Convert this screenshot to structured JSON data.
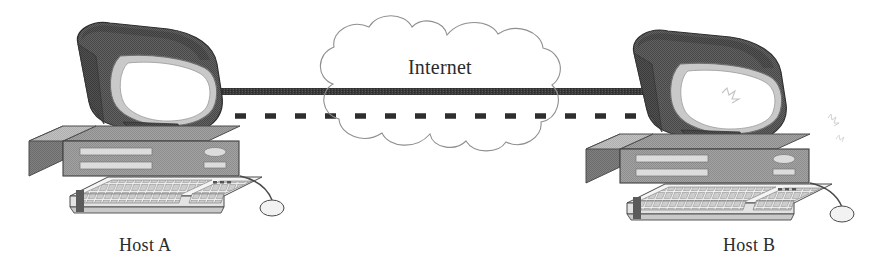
{
  "diagram": {
    "type": "network-topology",
    "background_color": "#ffffff"
  },
  "nodes": {
    "host_a": {
      "label": "Host A",
      "kind": "desktop-computer",
      "position": "left"
    },
    "host_b": {
      "label": "Host B",
      "kind": "desktop-computer",
      "position": "right"
    },
    "cloud": {
      "label": "Internet",
      "kind": "network-cloud",
      "position": "center"
    }
  },
  "links": [
    {
      "name": "solid-link",
      "style": "solid",
      "from": "host_a",
      "to": "host_b",
      "color": "#333333",
      "thickness_px": 7
    },
    {
      "name": "dashed-link",
      "style": "dashed",
      "from": "host_a",
      "to": "host_b",
      "color": "#2e2e2e",
      "thickness_px": 5,
      "dash_length_px": 11,
      "dash_gap_px": 19
    }
  ],
  "colors": {
    "monitor_shell_dark": "#5d5d5d",
    "monitor_shell_darker": "#4a4a4a",
    "monitor_bezel_light": "#c9c9c9",
    "screen_white": "#ffffff",
    "case_body": "#9a9a9a",
    "case_top": "#b4b4b4",
    "case_side": "#747474",
    "case_slot": "#d8d8d8",
    "keyboard_face": "#ededed",
    "keyboard_key": "#cfcfcf",
    "outline": "#3b3b3b",
    "cloud_outline": "#8f8f8f",
    "text": "#2b2b2b"
  }
}
